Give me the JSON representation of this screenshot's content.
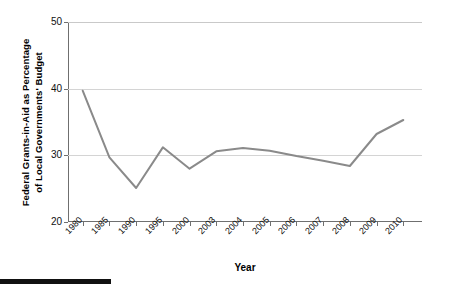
{
  "chart_data": {
    "type": "line",
    "title": "",
    "xlabel": "Year",
    "ylabel": "Federal Grants-in-Aid as Percentage of Local Governments' Budget",
    "ylabel_lines": [
      "Federal Grants-in-Aid as Percentage",
      "of Local Governments' Budget"
    ],
    "categories": [
      "1980",
      "1985",
      "1990",
      "1995",
      "2000",
      "2003",
      "2004",
      "2005",
      "2006",
      "2007",
      "2008",
      "2009",
      "2010"
    ],
    "values": [
      39.7,
      29.7,
      25.1,
      31.2,
      28.0,
      30.6,
      31.1,
      30.7,
      29.9,
      29.2,
      28.4,
      33.2,
      35.3
    ],
    "series": [
      {
        "name": "Federal Grants-in-Aid as Percentage of Local Governments' Budget",
        "values": [
          39.7,
          29.7,
          25.1,
          31.2,
          28.0,
          30.6,
          31.1,
          30.7,
          29.9,
          29.2,
          28.4,
          33.2,
          35.3
        ],
        "color": "#8a8a8a"
      }
    ],
    "ylim": [
      20,
      50
    ],
    "yticks": [
      20,
      30,
      40,
      50
    ],
    "ytick_labels": [
      "20",
      "30",
      "40",
      "50"
    ],
    "grid": true,
    "gridlines_at": [
      30,
      40,
      50
    ],
    "legend": "none",
    "markers": "none",
    "line_color": "#8a8a8a",
    "line_width": 2,
    "axis_color": "#6f6f6f",
    "grid_color": "#d4d4d4",
    "xtick_rotation": -45
  }
}
